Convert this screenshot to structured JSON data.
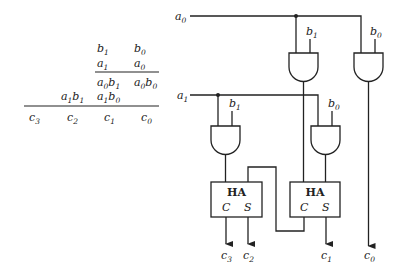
{
  "multiplication_table": {
    "rows": [
      {
        "cells": [
          {
            "col": 2,
            "var": "b",
            "sub": "1"
          },
          {
            "col": 3,
            "var": "b",
            "sub": "0"
          }
        ]
      },
      {
        "cells": [
          {
            "col": 2,
            "var": "a",
            "sub": "1"
          },
          {
            "col": 3,
            "var": "a",
            "sub": "0"
          }
        ]
      },
      {
        "cells": [
          {
            "col": 2,
            "terms": [
              [
                "a",
                "0"
              ],
              [
                "b",
                "1"
              ]
            ]
          },
          {
            "col": 3,
            "terms": [
              [
                "a",
                "0"
              ],
              [
                "b",
                "0"
              ]
            ]
          }
        ]
      },
      {
        "cells": [
          {
            "col": 1,
            "terms": [
              [
                "a",
                "1"
              ],
              [
                "b",
                "1"
              ]
            ]
          },
          {
            "col": 2,
            "terms": [
              [
                "a",
                "1"
              ],
              [
                "b",
                "0"
              ]
            ]
          }
        ]
      },
      {
        "cells": [
          {
            "col": 0,
            "var": "c",
            "sub": "3"
          },
          {
            "col": 1,
            "var": "c",
            "sub": "2"
          },
          {
            "col": 2,
            "var": "c",
            "sub": "1"
          },
          {
            "col": 3,
            "var": "c",
            "sub": "0"
          }
        ]
      }
    ]
  },
  "circuit": {
    "inputs": [
      {
        "var": "a",
        "sub": "0"
      },
      {
        "var": "a",
        "sub": "1"
      }
    ],
    "and_gates": [
      {
        "id": "and-a0b1",
        "input_label": {
          "var": "b",
          "sub": "1"
        }
      },
      {
        "id": "and-a0b0",
        "input_label": {
          "var": "b",
          "sub": "0"
        }
      },
      {
        "id": "and-a1b1",
        "input_label": {
          "var": "b",
          "sub": "1"
        }
      },
      {
        "id": "and-a1b0",
        "input_label": {
          "var": "b",
          "sub": "0"
        }
      }
    ],
    "half_adders": [
      {
        "id": "ha-left",
        "label": "HA",
        "carry": "C",
        "sum": "S"
      },
      {
        "id": "ha-right",
        "label": "HA",
        "carry": "C",
        "sum": "S"
      }
    ],
    "outputs": [
      {
        "var": "c",
        "sub": "3"
      },
      {
        "var": "c",
        "sub": "2"
      },
      {
        "var": "c",
        "sub": "1"
      },
      {
        "var": "c",
        "sub": "0"
      }
    ]
  },
  "colors": {
    "line": "#222222",
    "background": "#ffffff"
  }
}
